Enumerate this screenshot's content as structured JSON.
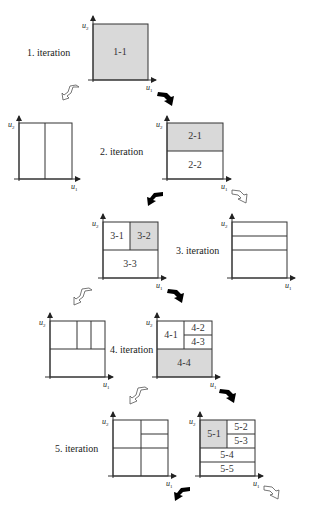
{
  "figure": {
    "axis_labels": {
      "x": "u",
      "x_sub": "1",
      "y": "u",
      "y_sub": "2"
    },
    "colors": {
      "selected_fill": "#d9d9d9",
      "line": "#333333",
      "solid_arrow": "#000000",
      "hollow_arrow": "#ffffff"
    },
    "iterations": [
      {
        "label": "1. iteration",
        "cells": [
          {
            "id": "1-1",
            "selected": true
          }
        ]
      },
      {
        "label": "2. iteration",
        "alternative": "vertical split in two",
        "cells": [
          {
            "id": "2-1",
            "selected": true
          },
          {
            "id": "2-2",
            "selected": false
          }
        ]
      },
      {
        "label": "3. iteration",
        "alternative": "horizontal split in three",
        "cells": [
          {
            "id": "3-1",
            "selected": false
          },
          {
            "id": "3-2",
            "selected": true
          },
          {
            "id": "3-3",
            "selected": false
          }
        ]
      },
      {
        "label": "4. iteration",
        "alternative": "top half split in three columns",
        "cells": [
          {
            "id": "4-1",
            "selected": false
          },
          {
            "id": "4-2",
            "selected": false
          },
          {
            "id": "4-3",
            "selected": false
          },
          {
            "id": "4-4",
            "selected": true
          }
        ]
      },
      {
        "label": "5. iteration",
        "alternative": "quadrants with top-right split",
        "cells": [
          {
            "id": "5-1",
            "selected": true
          },
          {
            "id": "5-2",
            "selected": false
          },
          {
            "id": "5-3",
            "selected": false
          },
          {
            "id": "5-4",
            "selected": false
          },
          {
            "id": "5-5",
            "selected": false
          }
        ]
      }
    ]
  }
}
